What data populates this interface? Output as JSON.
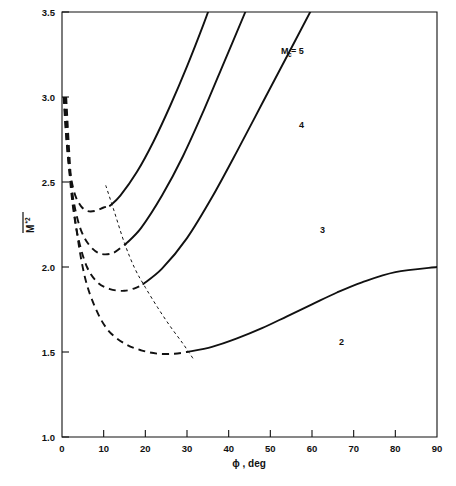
{
  "chart_data": {
    "type": "line",
    "title": "",
    "xlabel": "ϕ , deg",
    "ylabel": "M*2",
    "ylabel_parts": {
      "base": "M",
      "superscript": "*2",
      "overbar": true
    },
    "xlim": [
      0,
      90
    ],
    "ylim": [
      1.0,
      3.5
    ],
    "xticks": [
      0,
      10,
      20,
      30,
      40,
      50,
      60,
      70,
      80,
      90
    ],
    "xtick_labels": [
      "0",
      "10",
      "20",
      "30",
      "40",
      "50",
      "60",
      "70",
      "80",
      "90"
    ],
    "yticks": [
      1.0,
      1.5,
      2.0,
      2.5,
      3.0,
      3.5
    ],
    "ytick_labels": [
      "1.0",
      "1.5",
      "2.0",
      "2.5",
      "3.0",
      "3.5"
    ],
    "grid": false,
    "legend": "inline-curve-labels",
    "annotations": [
      {
        "name": "label-mc-5",
        "text": "M",
        "sub": "c",
        "eq": " = 5",
        "x": 58.5,
        "y": 73.5,
        "full": "M_c = 5"
      },
      {
        "name": "label-mc-4",
        "text": "4",
        "x": 62.5,
        "y": 52.0,
        "full": "4"
      },
      {
        "name": "label-mc-3",
        "text": "3",
        "x": 67.5,
        "y": 33.0,
        "full": "3"
      },
      {
        "name": "label-mc-2",
        "text": "2",
        "x": 72.0,
        "y": 22.0,
        "full": "2"
      }
    ],
    "series": [
      {
        "name": "Mc = 5",
        "label": "M_c = 5",
        "style": "solid-with-dashed-branch",
        "dashed_points": [
          [
            0.4,
            3.0
          ],
          [
            0.9,
            2.8
          ],
          [
            1.5,
            2.64
          ],
          [
            2.2,
            2.52
          ],
          [
            3.2,
            2.42
          ],
          [
            4.5,
            2.36
          ],
          [
            6.0,
            2.33
          ],
          [
            8.0,
            2.33
          ],
          [
            10.0,
            2.35
          ],
          [
            11.5,
            2.36
          ]
        ],
        "solid_points": [
          [
            11.5,
            2.36
          ],
          [
            14,
            2.42
          ],
          [
            18,
            2.56
          ],
          [
            22,
            2.74
          ],
          [
            26,
            2.95
          ],
          [
            30,
            3.18
          ],
          [
            34,
            3.43
          ],
          [
            36.5,
            3.6
          ]
        ]
      },
      {
        "name": "Mc = 4",
        "label": "4",
        "style": "solid-with-dashed-branch",
        "dashed_points": [
          [
            0.5,
            3.0
          ],
          [
            1.2,
            2.72
          ],
          [
            2.0,
            2.52
          ],
          [
            3.0,
            2.36
          ],
          [
            4.5,
            2.22
          ],
          [
            6.5,
            2.13
          ],
          [
            9.0,
            2.08
          ],
          [
            12.0,
            2.08
          ],
          [
            14.5,
            2.12
          ],
          [
            15.5,
            2.14
          ]
        ],
        "solid_points": [
          [
            15.5,
            2.14
          ],
          [
            19,
            2.23
          ],
          [
            24,
            2.42
          ],
          [
            29,
            2.65
          ],
          [
            34,
            2.92
          ],
          [
            39,
            3.21
          ],
          [
            44,
            3.5
          ],
          [
            46,
            3.62
          ]
        ]
      },
      {
        "name": "Mc = 3",
        "label": "3",
        "style": "solid-with-dashed-branch",
        "dashed_points": [
          [
            0.7,
            3.0
          ],
          [
            1.6,
            2.62
          ],
          [
            2.6,
            2.36
          ],
          [
            4.0,
            2.16
          ],
          [
            6.0,
            2.0
          ],
          [
            8.5,
            1.91
          ],
          [
            11.5,
            1.87
          ],
          [
            15.0,
            1.86
          ],
          [
            18.0,
            1.88
          ],
          [
            19.5,
            1.9
          ]
        ],
        "solid_points": [
          [
            19.5,
            1.9
          ],
          [
            24,
            1.99
          ],
          [
            30,
            2.17
          ],
          [
            36,
            2.41
          ],
          [
            42,
            2.68
          ],
          [
            48,
            2.96
          ],
          [
            54,
            3.24
          ],
          [
            60,
            3.52
          ],
          [
            62,
            3.62
          ]
        ]
      },
      {
        "name": "Mc = 2",
        "label": "2",
        "style": "solid-with-dashed-branch",
        "dashed_points": [
          [
            1.0,
            3.0
          ],
          [
            2.2,
            2.5
          ],
          [
            3.6,
            2.2
          ],
          [
            5.5,
            1.94
          ],
          [
            8.0,
            1.76
          ],
          [
            11.0,
            1.63
          ],
          [
            15.0,
            1.55
          ],
          [
            19.0,
            1.51
          ],
          [
            23.0,
            1.49
          ],
          [
            27.0,
            1.49
          ],
          [
            30.0,
            1.5
          ]
        ],
        "solid_points": [
          [
            30.0,
            1.5
          ],
          [
            36,
            1.53
          ],
          [
            42,
            1.58
          ],
          [
            48,
            1.64
          ],
          [
            54,
            1.71
          ],
          [
            60,
            1.78
          ],
          [
            66,
            1.85
          ],
          [
            72,
            1.91
          ],
          [
            80,
            1.97
          ],
          [
            90,
            2.0
          ]
        ]
      },
      {
        "name": "locus",
        "label": "",
        "style": "fine-dashed",
        "points": [
          [
            10.5,
            2.48
          ],
          [
            12.5,
            2.33
          ],
          [
            15.0,
            2.14
          ],
          [
            17.5,
            1.99
          ],
          [
            20.0,
            1.88
          ],
          [
            23.0,
            1.76
          ],
          [
            26.0,
            1.65
          ],
          [
            29.0,
            1.55
          ],
          [
            31.5,
            1.46
          ]
        ]
      }
    ]
  },
  "figure": {
    "background_color": "#ffffff",
    "line_color": "#111111"
  }
}
